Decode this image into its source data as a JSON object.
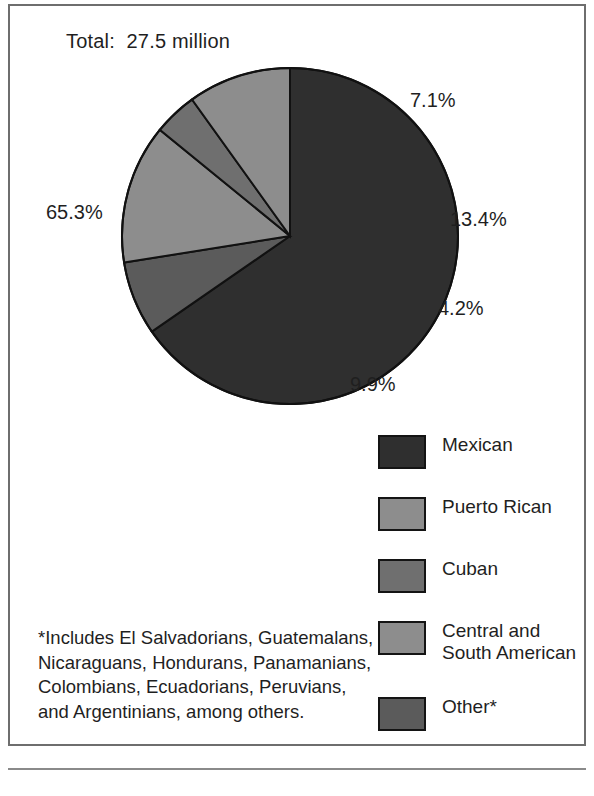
{
  "figure": {
    "total_label": "Total:  27.5 million",
    "footnote": "*Includes El Salvadorians, Guatemalans,\nNicaraguans, Hondurans, Panamanians,\nColombians, Ecuadorians, Peruvians,\nand Argentinians, among others."
  },
  "chart_data": {
    "type": "pie",
    "title": "Total:  27.5 million",
    "unit": "percent",
    "total": "27.5 million",
    "categories": [
      "Mexican",
      "Puerto Rican",
      "Cuban",
      "Central and\nSouth American",
      "Other*"
    ],
    "values": [
      65.3,
      9.9,
      4.2,
      13.4,
      7.1
    ],
    "labels": [
      "65.3%",
      "9.9%",
      "4.2%",
      "13.4%",
      "7.1%"
    ],
    "colors": [
      "#2f2f2f",
      "#8d8d8d",
      "#6f6f6f",
      "#8d8d8d",
      "#5b5b5b"
    ],
    "legend_position": "bottom-right",
    "grid": false,
    "slice_order_clockwise_from_top": [
      "Mexican",
      "Other*",
      "Central and South American",
      "Cuban",
      "Puerto Rican"
    ],
    "slices": [
      {
        "name": "Mexican",
        "value": 65.3,
        "label": "65.3%",
        "color": "#2f2f2f"
      },
      {
        "name": "Other*",
        "value": 7.1,
        "label": "7.1%",
        "color": "#5b5b5b"
      },
      {
        "name": "Central and South American",
        "value": 13.4,
        "label": "13.4%",
        "color": "#8d8d8d"
      },
      {
        "name": "Cuban",
        "value": 4.2,
        "label": "4.2%",
        "color": "#6f6f6f"
      },
      {
        "name": "Puerto Rican",
        "value": 9.9,
        "label": "9.9%",
        "color": "#8d8d8d"
      }
    ]
  },
  "legend": {
    "items": [
      {
        "label": "Mexican",
        "color": "#2f2f2f"
      },
      {
        "label": "Puerto Rican",
        "color": "#8d8d8d"
      },
      {
        "label": "Cuban",
        "color": "#6f6f6f"
      },
      {
        "label": "Central and\nSouth American",
        "color": "#8d8d8d"
      },
      {
        "label": "Other*",
        "color": "#5b5b5b"
      }
    ]
  }
}
